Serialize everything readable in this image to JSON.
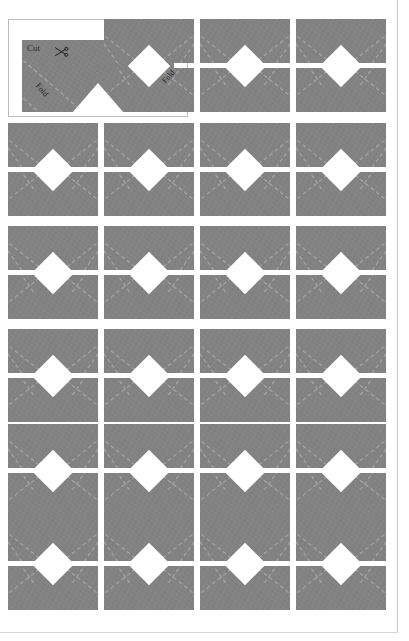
{
  "document": {
    "title": "Envelope / Paper Craft Cut-and-Fold Template Sheet",
    "page_width": 409,
    "page_height": 641,
    "background_color": "#ffffff",
    "page_edge_color": "#c9c9c9"
  },
  "header_template": {
    "box": {
      "x": 8,
      "y": 19,
      "width": 180,
      "height": 98
    },
    "border_color": "#bdbdbd",
    "panel_color": "#828282",
    "fold_line_color": "#b8b8b8",
    "labels": {
      "cut": "Cut",
      "fold_left": "Fold",
      "fold_right": "Fold"
    },
    "icons": {
      "scissors": "scissors-icon"
    },
    "notch": {
      "shape": "triangle",
      "position": "bottom-center",
      "color": "#ffffff",
      "half_width": 26,
      "height": 30
    }
  },
  "grid": {
    "columns": 4,
    "rows": 6,
    "cell_color": "#828282",
    "diamond_color": "#ffffff",
    "split_color": "#ffffff",
    "fold_line_color": "#b8b8b8",
    "column_x": [
      8,
      104,
      200,
      296
    ],
    "row_y": [
      19,
      123,
      226,
      329,
      424,
      517
    ],
    "cell_width": 90,
    "cell_height": 93,
    "split_gap": 5,
    "diamond_size": 30,
    "cells": [
      {
        "row": 1,
        "col": 1,
        "type": "header-template",
        "label": "Cut and Fold guide panel"
      },
      {
        "row": 1,
        "col": 2,
        "type": "envelope-template"
      },
      {
        "row": 1,
        "col": 3,
        "type": "envelope-template"
      },
      {
        "row": 1,
        "col": 4,
        "type": "envelope-template"
      },
      {
        "row": 2,
        "col": 1,
        "type": "envelope-template"
      },
      {
        "row": 2,
        "col": 2,
        "type": "envelope-template"
      },
      {
        "row": 2,
        "col": 3,
        "type": "envelope-template"
      },
      {
        "row": 2,
        "col": 4,
        "type": "envelope-template"
      },
      {
        "row": 3,
        "col": 1,
        "type": "envelope-template"
      },
      {
        "row": 3,
        "col": 2,
        "type": "envelope-template"
      },
      {
        "row": 3,
        "col": 3,
        "type": "envelope-template"
      },
      {
        "row": 3,
        "col": 4,
        "type": "envelope-template"
      },
      {
        "row": 4,
        "col": 1,
        "type": "envelope-template"
      },
      {
        "row": 4,
        "col": 2,
        "type": "envelope-template"
      },
      {
        "row": 4,
        "col": 3,
        "type": "envelope-template"
      },
      {
        "row": 4,
        "col": 4,
        "type": "envelope-template"
      },
      {
        "row": 5,
        "col": 1,
        "type": "envelope-template"
      },
      {
        "row": 5,
        "col": 2,
        "type": "envelope-template"
      },
      {
        "row": 5,
        "col": 3,
        "type": "envelope-template"
      },
      {
        "row": 5,
        "col": 4,
        "type": "envelope-template"
      },
      {
        "row": 6,
        "col": 1,
        "type": "envelope-template"
      },
      {
        "row": 6,
        "col": 2,
        "type": "envelope-template"
      },
      {
        "row": 6,
        "col": 3,
        "type": "envelope-template"
      },
      {
        "row": 6,
        "col": 4,
        "type": "envelope-template"
      }
    ]
  }
}
